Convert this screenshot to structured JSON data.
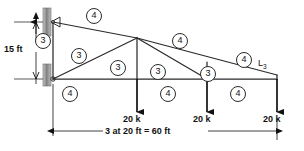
{
  "diagram": {
    "vertical_dimension": "15 ft",
    "horizontal_dimension": "3 at 20 ft = 60 ft",
    "node_label_right": "L",
    "node_label_right_sub": "3",
    "loads": [
      {
        "id": "load-1",
        "label": "20 k",
        "x": 137
      },
      {
        "id": "load-2",
        "label": "20 k",
        "x": 207
      },
      {
        "id": "load-3",
        "label": "20 k",
        "x": 277
      }
    ],
    "member_labels": [
      {
        "id": "m-top-chord-left",
        "value": "4",
        "x": 93,
        "y": 8
      },
      {
        "id": "m-left-vertical",
        "value": "3",
        "x": 42,
        "y": 33
      },
      {
        "id": "m-diagonal-lower-left",
        "value": "3",
        "x": 78,
        "y": 48
      },
      {
        "id": "m-vertical-mid",
        "value": "3",
        "x": 116,
        "y": 60
      },
      {
        "id": "m-top-chord-right",
        "value": "4",
        "x": 178,
        "y": 35
      },
      {
        "id": "m-diagonal-mid",
        "value": "3",
        "x": 155,
        "y": 64
      },
      {
        "id": "m-vertical-right",
        "value": "3",
        "x": 205,
        "y": 66
      },
      {
        "id": "m-top-chord-far-right",
        "value": "4",
        "x": 242,
        "y": 53
      },
      {
        "id": "m-bottom-chord-left",
        "value": "4",
        "x": 68,
        "y": 88
      },
      {
        "id": "m-bottom-chord-mid",
        "value": "4",
        "x": 165,
        "y": 88
      },
      {
        "id": "m-bottom-chord-right",
        "value": "4",
        "x": 235,
        "y": 88
      }
    ],
    "colors": {
      "line": "#2b2b2b",
      "support_plate": "#9a9a9a",
      "background": "#ffffff",
      "text": "#111111"
    }
  }
}
